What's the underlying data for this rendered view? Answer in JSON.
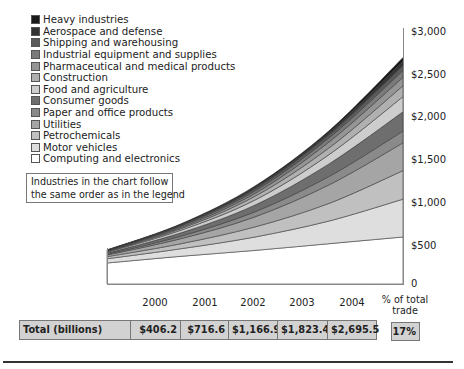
{
  "chart_data": {
    "type": "area",
    "stacked": true,
    "title": "",
    "xlabel": "",
    "ylabel": "",
    "x": [
      2000,
      2001,
      2002,
      2003,
      2004
    ],
    "ylim": [
      0,
      3000
    ],
    "yticks": [
      0,
      500,
      1000,
      1500,
      2000,
      2500,
      3000
    ],
    "ytick_labels": [
      "0",
      "$500",
      "$1,000",
      "$1,500",
      "$2,000",
      "$2,500",
      "$3,000"
    ],
    "y_axis_position": "right",
    "grid": false,
    "legend_position": "upper-left",
    "stack_order_bottom_to_top": [
      "Computing and electronics",
      "Motor vehicles",
      "Petrochemicals",
      "Utilities",
      "Paper and office products",
      "Consumer goods",
      "Food and agriculture",
      "Construction",
      "Pharmaceutical and medical products",
      "Industrial equipment and supplies",
      "Shipping and warehousing",
      "Aerospace and defense",
      "Heavy industries"
    ],
    "series": [
      {
        "name": "Heavy industries",
        "color": "#1a1a1a",
        "values": [
          3.2,
          7.6,
          14.9,
          18.4,
          45.5
        ]
      },
      {
        "name": "Aerospace and defense",
        "color": "#333333",
        "values": [
          3,
          9,
          17,
          25,
          50
        ]
      },
      {
        "name": "Shipping and warehousing",
        "color": "#5a5a5a",
        "values": [
          4,
          10,
          25,
          40,
          60
        ]
      },
      {
        "name": "Industrial equipment and supplies",
        "color": "#7a7a7a",
        "values": [
          5,
          15,
          30,
          50,
          80
        ]
      },
      {
        "name": "Pharmaceutical and medical products",
        "color": "#959595",
        "values": [
          6,
          15,
          35,
          70,
          100
        ]
      },
      {
        "name": "Construction",
        "color": "#b0b0b0",
        "values": [
          7,
          20,
          45,
          80,
          130
        ]
      },
      {
        "name": "Food and agriculture",
        "color": "#cdcdcd",
        "values": [
          10,
          30,
          60,
          110,
          180
        ]
      },
      {
        "name": "Consumer goods",
        "color": "#6e6e6e",
        "values": [
          13,
          40,
          80,
          150,
          230
        ]
      },
      {
        "name": "Paper and office products",
        "color": "#8a8a8a",
        "values": [
          10,
          30,
          60,
          100,
          140
        ]
      },
      {
        "name": "Utilities",
        "color": "#a5a5a5",
        "values": [
          20,
          60,
          120,
          220,
          330
        ]
      },
      {
        "name": "Petrochemicals",
        "color": "#c0c0c0",
        "values": [
          25,
          60,
          120,
          210,
          340
        ]
      },
      {
        "name": "Motor vehicles",
        "color": "#dedede",
        "values": [
          50,
          90,
          160,
          270,
          450
        ]
      },
      {
        "name": "Computing and electronics",
        "color": "#ffffff",
        "values": [
          250,
          330,
          400,
          480,
          560
        ]
      }
    ],
    "totals": {
      "label": "Total (billions)",
      "values": [
        "$406.2",
        "$716.6",
        "$1,166.9",
        "$1,823.4",
        "$2,695.5"
      ],
      "numeric": [
        406.2,
        716.6,
        1166.9,
        1823.4,
        2695.5
      ]
    },
    "share_of_total_trade": {
      "label": "% of total trade",
      "value": "17%"
    },
    "annotation": "Industries in the chart follow the same order as in the legend"
  },
  "legend": {
    "items": [
      {
        "label": "Heavy industries",
        "color": "#1a1a1a"
      },
      {
        "label": "Aerospace and defense",
        "color": "#333333"
      },
      {
        "label": "Shipping and warehousing",
        "color": "#5a5a5a"
      },
      {
        "label": "Industrial equipment and supplies",
        "color": "#7a7a7a"
      },
      {
        "label": "Pharmaceutical and medical products",
        "color": "#959595"
      },
      {
        "label": "Construction",
        "color": "#b0b0b0"
      },
      {
        "label": "Food and agriculture",
        "color": "#cdcdcd"
      },
      {
        "label": "Consumer goods",
        "color": "#6e6e6e"
      },
      {
        "label": "Paper and office products",
        "color": "#8a8a8a"
      },
      {
        "label": "Utilities",
        "color": "#a5a5a5"
      },
      {
        "label": "Petrochemicals",
        "color": "#c0c0c0"
      },
      {
        "label": "Motor vehicles",
        "color": "#dedede"
      },
      {
        "label": "Computing and electronics",
        "color": "#ffffff"
      }
    ]
  },
  "note": {
    "line1": "Industries in the chart follow",
    "line2": "the same order as in the legend"
  },
  "yaxis": {
    "ticks": [
      {
        "label": "$3,000",
        "value": 3000
      },
      {
        "label": "$2,500",
        "value": 2500
      },
      {
        "label": "$2,000",
        "value": 2000
      },
      {
        "label": "$1,500",
        "value": 1500
      },
      {
        "label": "$1,000",
        "value": 1000
      },
      {
        "label": "$500",
        "value": 500
      },
      {
        "label": "0",
        "value": 0
      }
    ]
  },
  "table": {
    "years": [
      "2000",
      "2001",
      "2002",
      "2003",
      "2004"
    ],
    "pct_header_line1": "% of total",
    "pct_header_line2": "trade",
    "total_label": "Total (billions)",
    "totals": [
      "$406.2",
      "$716.6",
      "$1,166.9",
      "$1,823.4",
      "$2,695.5"
    ],
    "pct_value": "17%"
  }
}
